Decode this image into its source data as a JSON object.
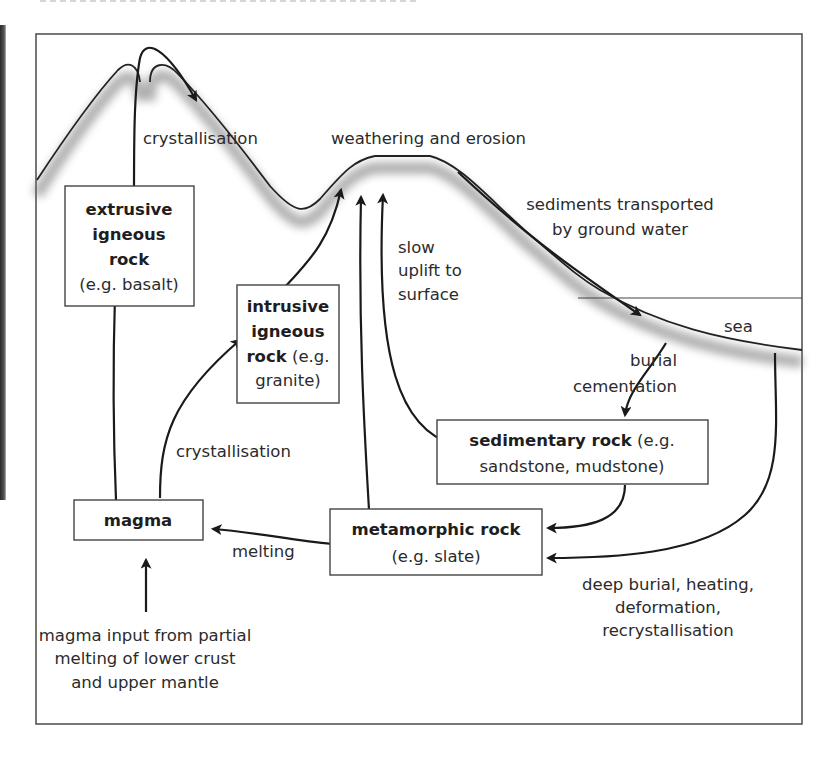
{
  "diagram": {
    "title_visible": false,
    "regions": {
      "sea_label": "sea"
    },
    "process_labels": {
      "crystallisation_top": "crystallisation",
      "weathering": "weathering and erosion",
      "sediments_transport": [
        "sediments transported",
        "by ground water"
      ],
      "uplift": [
        "slow",
        "uplift to",
        "surface"
      ],
      "burial": [
        "burial",
        "cementation"
      ],
      "crystallisation_mid": "crystallisation",
      "melting": "melting",
      "deep_burial": [
        "deep burial, heating,",
        "deformation,",
        "recrystallisation"
      ],
      "magma_input": [
        "magma input from partial",
        "melting of lower crust",
        "and upper mantle"
      ]
    },
    "boxes": {
      "extrusive": {
        "name_lines": [
          "extrusive",
          "igneous",
          "rock"
        ],
        "example": "(e.g. basalt)"
      },
      "intrusive": {
        "name_lines": [
          "intrusive",
          "igneous"
        ],
        "name_last": "rock",
        "example_inline": " (e.g.",
        "example_tail": "granite)"
      },
      "sedimentary": {
        "name": "sedimentary rock",
        "example_inline": " (e.g.",
        "example_tail": "sandstone, mudstone)"
      },
      "metamorphic": {
        "name": "metamorphic rock",
        "example": "(e.g. slate)"
      },
      "magma": {
        "name": "magma"
      }
    },
    "colors": {
      "line": "#1a1a1a",
      "box_border": "#444444",
      "text": "#2b2b2b"
    }
  }
}
